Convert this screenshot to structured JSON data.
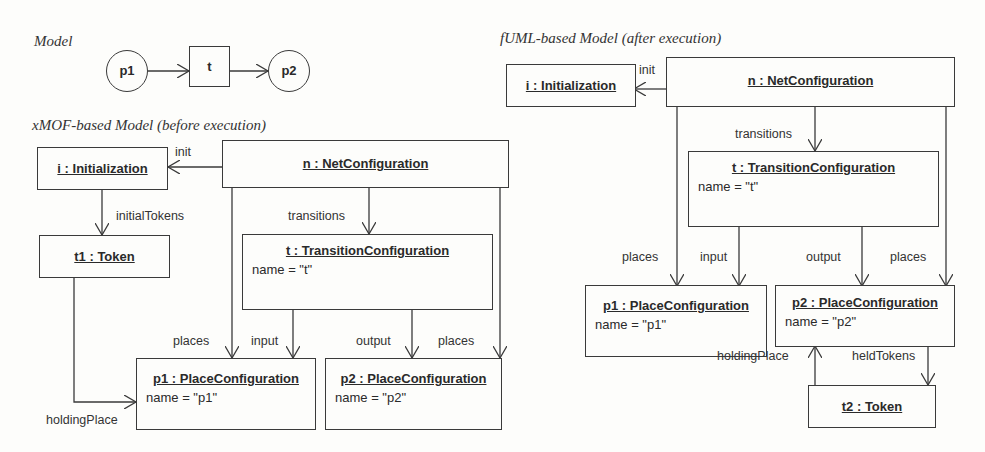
{
  "headings": {
    "model": "Model",
    "xmof": "xMOF-based Model (before execution)",
    "fuml": "fUML-based Model (after execution)"
  },
  "petri_net": {
    "places": [
      {
        "id": "p1",
        "label": "p1"
      },
      {
        "id": "p2",
        "label": "p2"
      }
    ],
    "transitions": [
      {
        "id": "t",
        "label": "t"
      }
    ],
    "arcs": [
      [
        "p1",
        "t"
      ],
      [
        "t",
        "p2"
      ]
    ]
  },
  "xmof": {
    "objects": {
      "init": {
        "title": "i : Initialization"
      },
      "net": {
        "title": "n : NetConfiguration"
      },
      "token": {
        "title": "t1 : Token"
      },
      "trans": {
        "title": "t : TransitionConfiguration",
        "attr": "name = \"t\""
      },
      "p1": {
        "title": "p1 : PlaceConfiguration",
        "attr": "name = \"p1\""
      },
      "p2": {
        "title": "p2 : PlaceConfiguration",
        "attr": "name = \"p2\""
      }
    },
    "links": {
      "init": "init",
      "initialTokens": "initialTokens",
      "transitions": "transitions",
      "places1": "places",
      "input": "input",
      "output": "output",
      "places2": "places",
      "holdingPlace": "holdingPlace"
    }
  },
  "fuml": {
    "objects": {
      "init": {
        "title": "i : Initialization"
      },
      "net": {
        "title": "n : NetConfiguration"
      },
      "trans": {
        "title": "t : TransitionConfiguration",
        "attr": "name = \"t\""
      },
      "p1": {
        "title": "p1 : PlaceConfiguration",
        "attr": "name = \"p1\""
      },
      "p2": {
        "title": "p2 : PlaceConfiguration",
        "attr": "name = \"p2\""
      },
      "token": {
        "title": "t2 : Token"
      }
    },
    "links": {
      "init": "init",
      "transitions": "transitions",
      "places1": "places",
      "input": "input",
      "output": "output",
      "places2": "places",
      "holdingPlace": "holdingPlace",
      "heldTokens": "heldTokens"
    }
  }
}
